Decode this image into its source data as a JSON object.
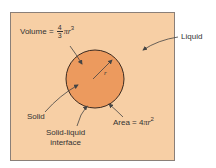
{
  "diagram": {
    "colors": {
      "liquid": "#f7cfa5",
      "solid": "#ec9a5e",
      "border": "#8a7f78",
      "outline": "#3b2a20",
      "arrow": "#444444"
    },
    "labels": {
      "volume_prefix": "Volume = ",
      "volume_num": "4",
      "volume_den": "3",
      "volume_suffix_pi": "π",
      "volume_suffix_r": "r",
      "volume_exp": "3",
      "liquid": "Liquid",
      "radius": "r",
      "solid": "Solid",
      "interface_line1": "Solid-liquid",
      "interface_line2": "interface",
      "area_prefix": "Area = 4",
      "area_pi": "π",
      "area_r": "r",
      "area_exp": "2"
    }
  }
}
